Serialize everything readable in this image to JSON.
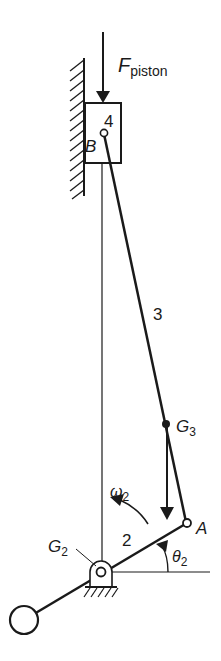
{
  "figure": {
    "labels": {
      "force": "F",
      "force_sub": "piston",
      "link4": "4",
      "pin_b": "B",
      "link3": "3",
      "g3": "G",
      "g3_sub": "3",
      "omega": "ω",
      "omega_sub": "2",
      "pin_a": "A",
      "g2": "G",
      "g2_sub": "2",
      "link2": "2",
      "theta": "θ",
      "theta_sub": "2"
    },
    "colors": {
      "ink": "#1a1a1a",
      "background": "#ffffff"
    }
  }
}
